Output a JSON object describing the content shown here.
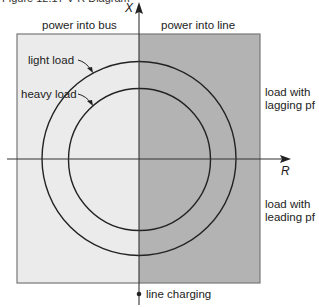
{
  "figure": {
    "caption": "Figure 12.17  V-R Diagram"
  },
  "axes": {
    "x_label": "R",
    "y_label": "X"
  },
  "regions": {
    "left_label": "power into bus",
    "right_label": "power into line",
    "left_fill": "#ebebeb",
    "right_fill": "#b3b3b3"
  },
  "curves": {
    "outer_label": "light load",
    "inner_label": "heavy load"
  },
  "annotations": {
    "upper_right_line1": "load with",
    "upper_right_line2": "lagging pf",
    "lower_right_line1": "load with",
    "lower_right_line2": "leading pf",
    "bottom_point": "line charging"
  }
}
